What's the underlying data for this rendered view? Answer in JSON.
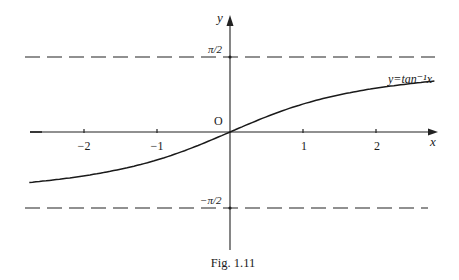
{
  "chart_data": {
    "type": "line",
    "title": "",
    "caption": "Fig. 1.11",
    "xlabel": "x",
    "ylabel": "y",
    "origin_label": "O",
    "xlim": [
      -2.75,
      2.8
    ],
    "ylim": [
      -1.5708,
      1.5708
    ],
    "grid": false,
    "x_ticks": [
      -2,
      -1,
      1,
      2
    ],
    "x_tick_labels": [
      "−2",
      "−1",
      "1",
      "2"
    ],
    "asymptotes": [
      {
        "y": 1.5708,
        "label": "π/2",
        "style": "dashed"
      },
      {
        "y": -1.5708,
        "label": "−π/2",
        "style": "dashed"
      }
    ],
    "series": [
      {
        "name": "y=tan⁻¹x",
        "label": "y=tan⁻¹x",
        "x": [
          -2.75,
          -2.5,
          -2,
          -1.5,
          -1,
          -0.5,
          0,
          0.5,
          1,
          1.5,
          2,
          2.5,
          2.8
        ],
        "y": [
          -1.222,
          -1.19,
          -1.107,
          -0.983,
          -0.785,
          -0.464,
          0,
          0.464,
          0.785,
          0.983,
          1.107,
          1.19,
          1.228
        ]
      }
    ]
  },
  "labels": {
    "y_axis": "y",
    "x_axis": "x",
    "origin": "O",
    "pi_half": "π/2",
    "neg_pi_half": "−π/2",
    "curve": "y=tan⁻¹x",
    "caption": "Fig. 1.11",
    "ticks": {
      "m2": "−2",
      "m1": "−1",
      "p1": "1",
      "p2": "2"
    }
  }
}
